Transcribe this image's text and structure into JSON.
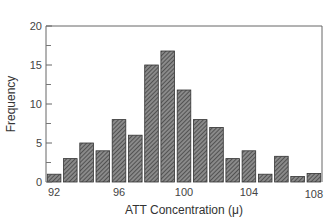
{
  "chart_data": {
    "type": "bar",
    "title": "",
    "xlabel": "ATT Concentration (μ)",
    "ylabel": "Frequency",
    "ylim": [
      0,
      20
    ],
    "xlim": [
      91.5,
      108.5
    ],
    "grid": false,
    "legend": null,
    "bar_style": "diagonal hatch, dark gray",
    "categories": [
      92,
      93,
      94,
      95,
      96,
      97,
      98,
      99,
      100,
      101,
      102,
      103,
      104,
      105,
      106,
      107,
      108
    ],
    "values": [
      1,
      3,
      5,
      4,
      8,
      6,
      15,
      16.8,
      11.8,
      8,
      7,
      3,
      4,
      1,
      3.3,
      0.7,
      1.1
    ],
    "x_ticks": [
      92,
      96,
      100,
      104,
      108
    ],
    "y_ticks": [
      0,
      5,
      10,
      15,
      20
    ],
    "y_minor_ticks": [
      2.5,
      7.5,
      12.5,
      17.5
    ]
  },
  "labels": {
    "x_axis": "ATT Concentration (μ)",
    "y_axis": "Frequency"
  }
}
